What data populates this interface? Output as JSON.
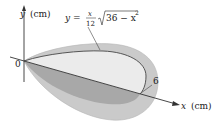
{
  "diagram": {
    "type": "solid-of-revolution-figure",
    "y_axis_label": {
      "var": "y",
      "unit": "(cm)"
    },
    "x_axis_label": {
      "var": "x",
      "unit": "(cm)"
    },
    "origin_label": "0",
    "x_end_label": "6",
    "curve_equation": {
      "lhs": "y =",
      "frac_num": "x",
      "frac_den": "12",
      "radicand": "36 − x",
      "exponent": "2"
    },
    "colors": {
      "outer_surface": "#c9c9c9",
      "inner_section": "#e6e6e6",
      "lower_section": "#a9a9a9",
      "curve": "#555555",
      "axis": "#333333"
    }
  }
}
